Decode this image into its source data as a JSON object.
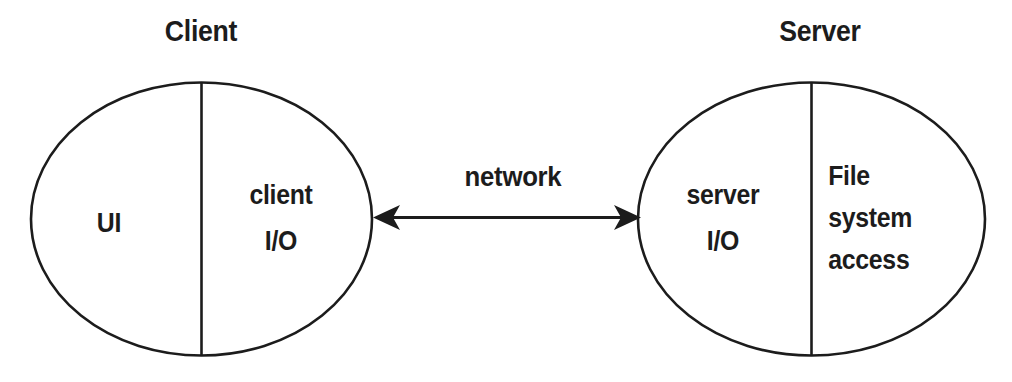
{
  "diagram": {
    "title_client": "Client",
    "title_server": "Server",
    "edge_label": "network",
    "colors": {
      "stroke": "#1c1c1c",
      "text": "#1c1c1c",
      "background": "#ffffff"
    },
    "nodes": [
      {
        "id": "client",
        "title": "Client",
        "regions": [
          {
            "id": "client-ui",
            "label": "UI"
          },
          {
            "id": "client-io",
            "label": "client\nI/O"
          }
        ]
      },
      {
        "id": "server",
        "title": "Server",
        "regions": [
          {
            "id": "server-io",
            "label": "server\nI/O"
          },
          {
            "id": "server-fs",
            "label": "File\nsystem\naccess"
          }
        ]
      }
    ],
    "edges": [
      {
        "id": "network-link",
        "label": "network",
        "from": "client",
        "to": "server",
        "arrow": "double"
      }
    ],
    "labels": {
      "client_ui": "UI",
      "client_io_line1": "client",
      "client_io_line2": "I/O",
      "server_io_line1": "server",
      "server_io_line2": "I/O",
      "server_fs_line1": "File",
      "server_fs_line2": "system",
      "server_fs_line3": "access"
    }
  }
}
